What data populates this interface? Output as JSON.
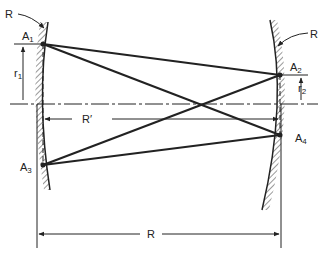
{
  "diagram": {
    "labels": {
      "R_left": "R",
      "R_right": "R",
      "A1": "A",
      "A1_sub": "1",
      "A2": "A",
      "A2_sub": "2",
      "A3": "A",
      "A3_sub": "3",
      "A4": "A",
      "A4_sub": "4",
      "r1": "r",
      "r1_sub": "1",
      "r2": "r",
      "r2_sub": "2",
      "R_prime": "R′",
      "R_bottom": "R"
    },
    "points": {
      "A1": [
        43,
        44
      ],
      "A2": [
        280,
        75
      ],
      "A3": [
        43,
        165
      ],
      "A4": [
        280,
        135
      ]
    },
    "beam_paths": [
      [
        "A1",
        "A2"
      ],
      [
        "A1",
        "A4"
      ],
      [
        "A3",
        "A2"
      ],
      [
        "A3",
        "A4"
      ]
    ],
    "colors": {
      "line": "#222222",
      "background": "#ffffff"
    }
  }
}
